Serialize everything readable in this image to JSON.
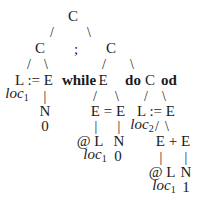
{
  "diagram": {
    "type": "parse-tree",
    "root": {
      "label": "C",
      "x": 73,
      "y": 16
    },
    "nodes": [
      {
        "id": "n_root",
        "label": "C",
        "x": 73,
        "y": 16,
        "style": "normal"
      },
      {
        "id": "n_c_left",
        "label": "C",
        "x": 40,
        "y": 48,
        "style": "normal"
      },
      {
        "id": "n_semicolon",
        "label": ";",
        "x": 76,
        "y": 49,
        "style": "normal"
      },
      {
        "id": "n_c_right",
        "label": "C",
        "x": 111,
        "y": 48,
        "style": "normal"
      },
      {
        "id": "n_assign1",
        "label": "L := E",
        "x": 34,
        "y": 80,
        "style": "normal"
      },
      {
        "id": "n_while",
        "label": "while",
        "x": 79,
        "y": 80,
        "style": "bold"
      },
      {
        "id": "n_while_e",
        "label": "E",
        "x": 103,
        "y": 80,
        "style": "normal"
      },
      {
        "id": "n_do",
        "label": "do",
        "x": 133,
        "y": 80,
        "style": "bold"
      },
      {
        "id": "n_body_c",
        "label": "C",
        "x": 150,
        "y": 80,
        "style": "normal"
      },
      {
        "id": "n_od",
        "label": "od",
        "x": 169,
        "y": 80,
        "style": "bold"
      },
      {
        "id": "n_loc1_a",
        "label": "loc",
        "sub": "1",
        "x": 17,
        "y": 95,
        "style": "italic"
      },
      {
        "id": "n_n1",
        "label": "N",
        "x": 45,
        "y": 111,
        "style": "normal"
      },
      {
        "id": "n_zero1",
        "label": "0",
        "x": 45,
        "y": 126,
        "style": "normal"
      },
      {
        "id": "n_eq",
        "label": "E = E",
        "x": 108,
        "y": 111,
        "style": "normal"
      },
      {
        "id": "n_assign2",
        "label": "L := E",
        "x": 156,
        "y": 111,
        "style": "normal"
      },
      {
        "id": "n_loc2",
        "label": "loc",
        "sub": "2",
        "x": 142,
        "y": 126,
        "style": "italic"
      },
      {
        "id": "n_deref1",
        "label": "@ L",
        "x": 90,
        "y": 141,
        "style": "normal"
      },
      {
        "id": "n_n2",
        "label": "N",
        "x": 119,
        "y": 141,
        "style": "normal"
      },
      {
        "id": "n_plus",
        "label": "E + E",
        "x": 173,
        "y": 141,
        "style": "normal"
      },
      {
        "id": "n_loc1_b",
        "label": "loc",
        "sub": "1",
        "x": 95,
        "y": 156,
        "style": "italic"
      },
      {
        "id": "n_zero2",
        "label": "0",
        "x": 118,
        "y": 156,
        "style": "normal"
      },
      {
        "id": "n_deref2",
        "label": "@ L",
        "x": 162,
        "y": 172,
        "style": "normal"
      },
      {
        "id": "n_n3",
        "label": "N",
        "x": 186,
        "y": 172,
        "style": "normal"
      },
      {
        "id": "n_loc1_c",
        "label": "loc",
        "sub": "1",
        "x": 164,
        "y": 187,
        "style": "italic"
      },
      {
        "id": "n_one",
        "label": "1",
        "x": 186,
        "y": 187,
        "style": "normal"
      }
    ],
    "edges": [
      {
        "glyph": "/",
        "x": 52,
        "y": 32
      },
      {
        "glyph": "\\",
        "x": 89,
        "y": 32
      },
      {
        "glyph": "/",
        "x": 29,
        "y": 64
      },
      {
        "glyph": "\\",
        "x": 46,
        "y": 64
      },
      {
        "glyph": "/",
        "x": 104,
        "y": 64
      },
      {
        "glyph": "\\",
        "x": 132,
        "y": 64
      },
      {
        "glyph": "|",
        "x": 45,
        "y": 96
      },
      {
        "glyph": "/",
        "x": 95,
        "y": 96
      },
      {
        "glyph": "\\",
        "x": 117,
        "y": 96
      },
      {
        "glyph": "/",
        "x": 146,
        "y": 96
      },
      {
        "glyph": "\\",
        "x": 164,
        "y": 96
      },
      {
        "glyph": "|",
        "x": 96,
        "y": 126
      },
      {
        "glyph": "|",
        "x": 119,
        "y": 126
      },
      {
        "glyph": "/",
        "x": 157,
        "y": 126
      },
      {
        "glyph": "\\",
        "x": 167,
        "y": 126
      },
      {
        "glyph": "|",
        "x": 161,
        "y": 157
      },
      {
        "glyph": "|",
        "x": 186,
        "y": 157
      }
    ]
  },
  "labels": {
    "root_c": "C",
    "c_left": "C",
    "semicolon": ";",
    "c_right": "C",
    "assign1": "L := E",
    "while": "while",
    "while_e": "E",
    "do": "do",
    "body_c": "C",
    "od": "od",
    "loc": "loc",
    "sub1": "1",
    "sub2": "2",
    "n": "N",
    "zero": "0",
    "eq": "E = E",
    "assign2": "L := E",
    "deref": "@ L",
    "plus": "E + E",
    "one": "1",
    "slash": "/",
    "backslash": "\\",
    "bar": "|"
  }
}
